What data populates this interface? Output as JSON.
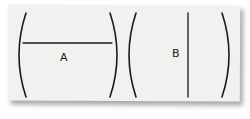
{
  "diagram": {
    "panels": [
      {
        "label": "A",
        "line_orientation": "horizontal"
      },
      {
        "label": "B",
        "line_orientation": "vertical"
      }
    ],
    "colors": {
      "paper": "#f1f1ef",
      "ink": "#1a1a1a"
    }
  }
}
